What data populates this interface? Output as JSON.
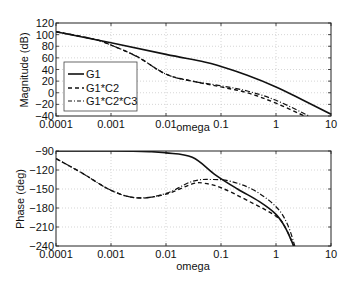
{
  "chart_data": [
    {
      "type": "line",
      "title": "",
      "xlabel": "omega",
      "ylabel": "Magnitude (dB)",
      "xscale": "log",
      "xlim": [
        0.0001,
        10
      ],
      "ylim": [
        -40,
        120
      ],
      "xticks": [
        "0.0001",
        "0.001",
        "0.01",
        "0.1",
        "1",
        "10"
      ],
      "yticks": [
        "120",
        "100",
        "80",
        "60",
        "40",
        "20",
        "0",
        "-20",
        "-40"
      ],
      "grid": true,
      "legend_position": "lower left",
      "series": [
        {
          "name": "G1",
          "style": "solid",
          "x": [
            0.0001,
            0.001,
            0.01,
            0.05,
            0.1,
            0.3,
            1,
            3,
            10
          ],
          "values": [
            105,
            86,
            66,
            53,
            45,
            30,
            10,
            -12,
            -37
          ]
        },
        {
          "name": "G1*C2",
          "style": "dashed",
          "x": [
            0.0001,
            0.0005,
            0.001,
            0.003,
            0.01,
            0.03,
            0.1,
            0.3,
            1,
            3.3
          ],
          "values": [
            105,
            92,
            82,
            62,
            32,
            20,
            10,
            0,
            -18,
            -40
          ]
        },
        {
          "name": "G1*C2*C3",
          "style": "dash-dot",
          "x": [
            0.0001,
            0.0005,
            0.001,
            0.003,
            0.01,
            0.03,
            0.1,
            0.3,
            1,
            4
          ],
          "values": [
            105,
            92,
            82,
            62,
            32,
            20,
            12,
            3,
            -13,
            -40
          ]
        }
      ]
    },
    {
      "type": "line",
      "title": "",
      "xlabel": "omega",
      "ylabel": "Phase (deg)",
      "xscale": "log",
      "xlim": [
        0.0001,
        10
      ],
      "ylim": [
        -240,
        -90
      ],
      "xticks": [
        "0.0001",
        "0.001",
        "0.01",
        "0.1",
        "1",
        "10"
      ],
      "yticks": [
        "-90",
        "-120",
        "-150",
        "-180",
        "-210",
        "-240"
      ],
      "grid": true,
      "series": [
        {
          "name": "G1",
          "style": "solid",
          "x": [
            0.0001,
            0.001,
            0.005,
            0.01,
            0.03,
            0.08,
            0.2,
            0.5,
            1,
            1.5,
            2.1
          ],
          "values": [
            -90,
            -90,
            -91,
            -93,
            -100,
            -128,
            -150,
            -170,
            -190,
            -212,
            -240
          ]
        },
        {
          "name": "G1*C2",
          "style": "dashed",
          "x": [
            0.0001,
            0.0003,
            0.001,
            0.003,
            0.01,
            0.03,
            0.05,
            0.1,
            0.3,
            1,
            1.5,
            2.1
          ],
          "values": [
            -102,
            -125,
            -152,
            -164,
            -158,
            -142,
            -141,
            -148,
            -168,
            -193,
            -212,
            -240
          ]
        },
        {
          "name": "G1*C2*C3",
          "style": "dash-dot",
          "x": [
            0.0001,
            0.0003,
            0.001,
            0.003,
            0.01,
            0.03,
            0.07,
            0.15,
            0.4,
            1,
            1.6,
            2.2
          ],
          "values": [
            -102,
            -125,
            -152,
            -164,
            -157,
            -138,
            -135,
            -138,
            -152,
            -178,
            -205,
            -240
          ]
        }
      ]
    }
  ],
  "legend": {
    "entries": [
      "G1",
      "G1*C2",
      "G1*C2*C3"
    ]
  },
  "top_plot": {
    "ylabel": "Magnitude (dB)",
    "xlabel": "omega",
    "yticks": [
      "120",
      "100",
      "80",
      "60",
      "40",
      "20",
      "0",
      "-20",
      "-40"
    ],
    "xticks": [
      "0.0001",
      "0.001",
      "0.01",
      "0.1",
      "1",
      "10"
    ]
  },
  "bottom_plot": {
    "ylabel": "Phase (deg)",
    "xlabel": "omega",
    "yticks": [
      "-90",
      "-120",
      "-150",
      "-180",
      "-210",
      "-240"
    ],
    "xticks": [
      "0.0001",
      "0.001",
      "0.01",
      "0.1",
      "1",
      "10"
    ]
  }
}
